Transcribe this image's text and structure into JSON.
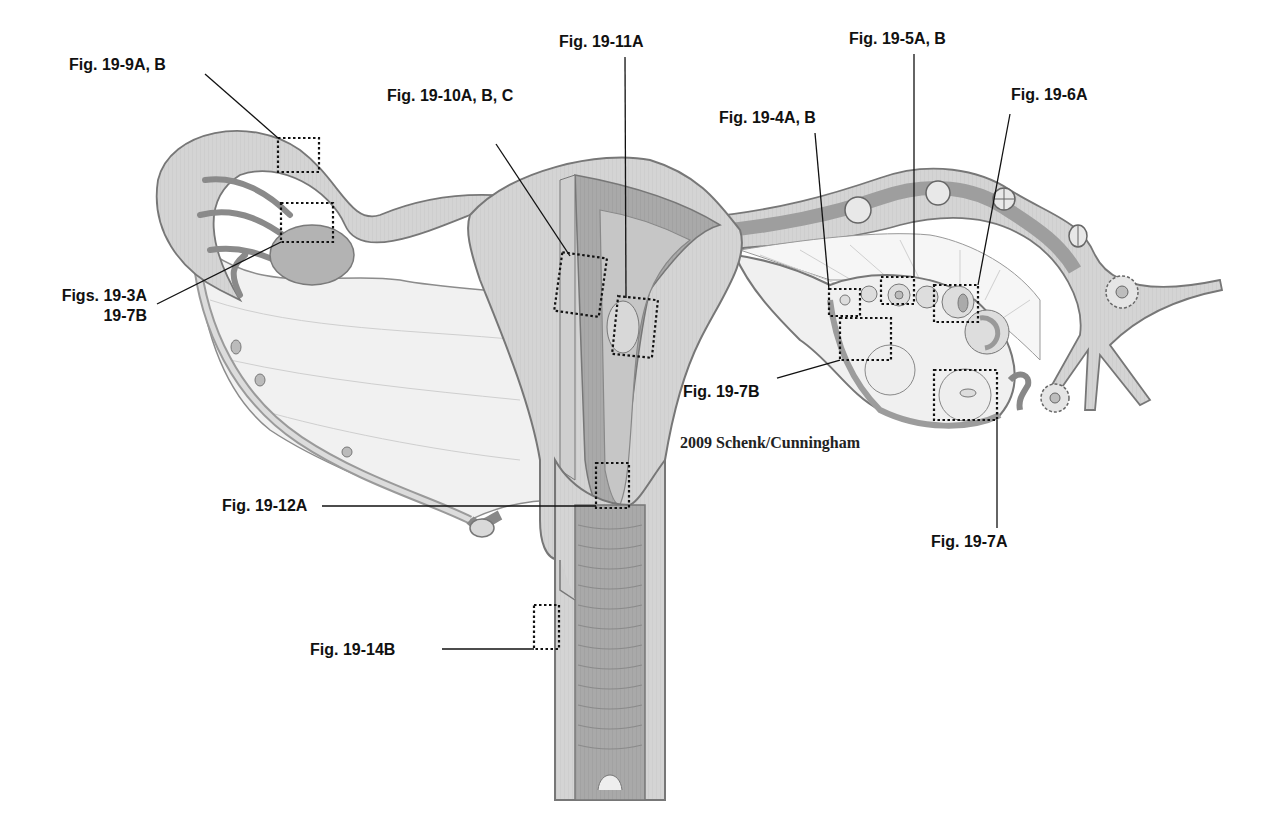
{
  "figure": {
    "credit": "2009 Schenk/Cunningham",
    "colors": {
      "tissue_light": "#d6d6d6",
      "tissue_mid": "#bdbdbd",
      "tissue_dark": "#9a9a9a",
      "outline": "#6f6f6f",
      "label_text": "#111111",
      "leader_line": "#111111"
    }
  },
  "labels": [
    {
      "id": "fig-19-9",
      "text": "Fig. 19-9A, B"
    },
    {
      "id": "figs-19-3a",
      "text": "Figs. 19-3A"
    },
    {
      "id": "figs-19-3a-line2",
      "text": "19-7B"
    },
    {
      "id": "fig-19-10",
      "text": "Fig. 19-10A, B, C"
    },
    {
      "id": "fig-19-11",
      "text": "Fig. 19-11A"
    },
    {
      "id": "fig-19-4",
      "text": "Fig. 19-4A, B"
    },
    {
      "id": "fig-19-5",
      "text": "Fig. 19-5A, B"
    },
    {
      "id": "fig-19-6",
      "text": "Fig. 19-6A"
    },
    {
      "id": "fig-19-7b",
      "text": "Fig. 19-7B"
    },
    {
      "id": "fig-19-7a",
      "text": "Fig. 19-7A"
    },
    {
      "id": "fig-19-12",
      "text": "Fig. 19-12A"
    },
    {
      "id": "fig-19-14",
      "text": "Fig. 19-14B"
    }
  ]
}
